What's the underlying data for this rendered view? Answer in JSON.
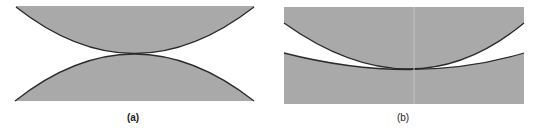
{
  "figure": {
    "panels": [
      {
        "id": "a",
        "label": "(a)",
        "description": "Two convex surfaces in point contact"
      },
      {
        "id": "b",
        "label": "(b)",
        "description": "Convex surface on a concave (conforming) surface"
      }
    ],
    "colors": {
      "fill": "#a9a9a9",
      "edge": "#2a2a2a",
      "background": "#ffffff"
    }
  }
}
